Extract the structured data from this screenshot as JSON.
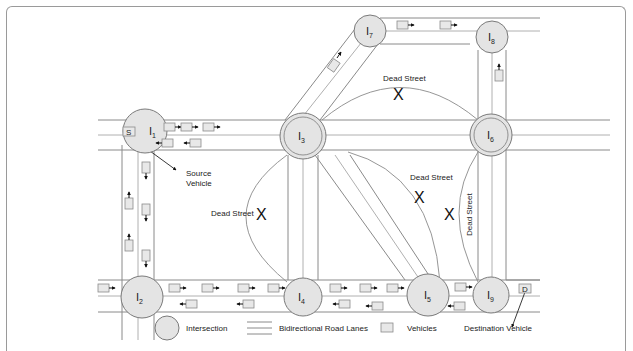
{
  "diagram": {
    "type": "road-network",
    "intersections": [
      {
        "id": "I1",
        "label": "I",
        "sub": "1",
        "x": 145,
        "y": 131
      },
      {
        "id": "I2",
        "label": "I",
        "sub": "2",
        "x": 142,
        "y": 297
      },
      {
        "id": "I3",
        "label": "I",
        "sub": "3",
        "x": 303,
        "y": 136
      },
      {
        "id": "I4",
        "label": "I",
        "sub": "4",
        "x": 303,
        "y": 297
      },
      {
        "id": "I5",
        "label": "I",
        "sub": "5",
        "x": 428,
        "y": 295
      },
      {
        "id": "I6",
        "label": "I",
        "sub": "6",
        "x": 491,
        "y": 135
      },
      {
        "id": "I7",
        "label": "I",
        "sub": "7",
        "x": 370,
        "y": 31
      },
      {
        "id": "I8",
        "label": "I",
        "sub": "8",
        "x": 492,
        "y": 37
      },
      {
        "id": "I9",
        "label": "I",
        "sub": "9",
        "x": 491,
        "y": 295
      }
    ],
    "annotations": {
      "source_marker": "S",
      "source_label_line1": "Source",
      "source_label_line2": "Vehicle",
      "destination_marker": "D",
      "dead_street": "Dead Street",
      "blocked_symbol": "X"
    },
    "legend": {
      "intersection": "Intersection",
      "lanes": "Bidirectional Road Lanes",
      "vehicles": "Vehicles",
      "destination": "Destination Vehicle"
    },
    "colors": {
      "node_fill": "#e4e4e4",
      "stroke": "#8a8a8a",
      "text": "#222222"
    }
  }
}
